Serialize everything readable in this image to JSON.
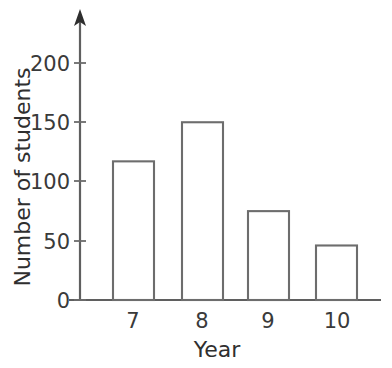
{
  "chart_data": {
    "type": "bar",
    "title": "",
    "subtitle": "",
    "xlabel": "Year",
    "ylabel": "Number of students",
    "categories": [
      "7",
      "8",
      "9",
      "10"
    ],
    "values": [
      117,
      150,
      75,
      46
    ],
    "series": [
      {
        "name": "Number of students",
        "values": [
          117,
          150,
          75,
          46
        ]
      }
    ],
    "ylim": [
      0,
      215
    ],
    "xlim": [
      6.4,
      10.9
    ],
    "y_ticks": [
      "0",
      "50",
      "100",
      "150",
      "200"
    ],
    "y_tick_values": [
      0,
      50,
      100,
      150,
      200
    ],
    "x_ticks": [
      "7",
      "8",
      "9",
      "10"
    ],
    "grid": false,
    "legend": false,
    "legend_position": "none",
    "bar_fill_color": "#ffffff",
    "bar_edge_color": "#6d6d6d",
    "axis_color": "#5f5f5f",
    "text_color": "#3a3a3a",
    "background_color": "#ffffff",
    "y_axis_arrow": true,
    "x_axis_arrow": false
  },
  "axes": {
    "y_title": "Number of students",
    "x_title": "Year"
  },
  "bars": [
    {
      "category": "7",
      "value": 117,
      "label": "7"
    },
    {
      "category": "8",
      "value": 150,
      "label": "8"
    },
    {
      "category": "9",
      "value": 75,
      "label": "9"
    },
    {
      "category": "10",
      "value": 46,
      "label": "10"
    }
  ],
  "y_ticks": [
    {
      "label": "200",
      "value": 200
    },
    {
      "label": "150",
      "value": 150
    },
    {
      "label": "100",
      "value": 100
    },
    {
      "label": "50",
      "value": 50
    },
    {
      "label": "0",
      "value": 0
    }
  ]
}
